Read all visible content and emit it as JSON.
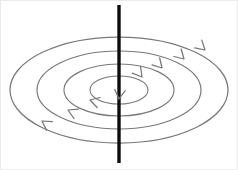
{
  "figure": {
    "title": "Magnetic field loops around a vertical current-carrying wire",
    "width": 238,
    "height": 170,
    "background_color": "#ffffff",
    "border_color": "#eceaea"
  },
  "axis": {
    "name": "vertical-wire",
    "color": "#0d0d0d",
    "x": 119,
    "y_top": 5,
    "y_bottom": 163,
    "stroke_width": 3.4
  },
  "ellipses": {
    "center_x": 119,
    "center_y": 90,
    "stroke_color": "#797979",
    "rings": [
      {
        "label": "ring-4-outer",
        "rx": 109,
        "ry": 53,
        "stroke_width": 1.25
      },
      {
        "label": "ring-3",
        "rx": 82,
        "ry": 39,
        "stroke_width": 1.2
      },
      {
        "label": "ring-2",
        "rx": 55,
        "ry": 26,
        "stroke_width": 1.15
      },
      {
        "label": "ring-1-inner",
        "rx": 29,
        "ry": 14,
        "stroke_width": 1.1
      }
    ]
  },
  "arrows": {
    "stroke_color": "#767676",
    "direction_note": "clockwise viewed from above: right side moves toward viewer-front, left side moves away",
    "items": [
      {
        "label": "arrow-ring4-right-back",
        "x": 205,
        "y": 50,
        "rotation": 42
      },
      {
        "label": "arrow-ring3-right-back",
        "x": 184,
        "y": 59,
        "rotation": 44
      },
      {
        "label": "arrow-ring2-right-back",
        "x": 162,
        "y": 68,
        "rotation": 47
      },
      {
        "label": "arrow-ring1-right-back",
        "x": 142,
        "y": 77,
        "rotation": 52
      },
      {
        "label": "arrow-ring1-front-center",
        "x": 119,
        "y": 99,
        "rotation": 96
      },
      {
        "label": "arrow-ring2-left-front",
        "x": 90,
        "y": 100,
        "rotation": 196
      },
      {
        "label": "arrow-ring3-left-front",
        "x": 68,
        "y": 110,
        "rotation": 205
      },
      {
        "label": "arrow-ring4-left-front",
        "x": 42,
        "y": 121,
        "rotation": 214
      }
    ]
  }
}
